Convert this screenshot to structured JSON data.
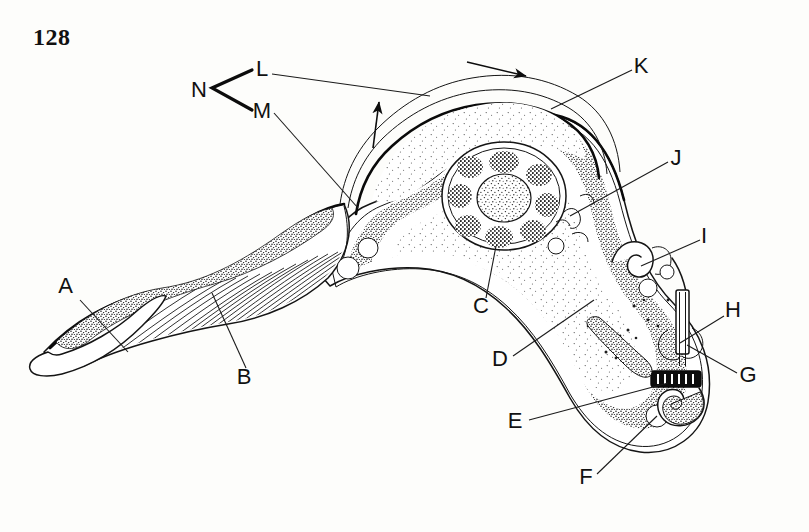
{
  "page": {
    "number": "128",
    "background_color": "#fdfdfb",
    "ink_color": "#141414"
  },
  "figure": {
    "style": "ink line drawing with stippling"
  },
  "labels": [
    {
      "id": "A",
      "text": "A",
      "x": 73,
      "y": 293,
      "anchor": "end",
      "leader": {
        "from": [
          80,
          300
        ],
        "to": [
          128,
          352
        ]
      }
    },
    {
      "id": "B",
      "text": "B",
      "x": 244,
      "y": 384,
      "anchor": "middle",
      "leader": {
        "from": [
          246,
          368
        ],
        "to": [
          212,
          293
        ]
      }
    },
    {
      "id": "C",
      "text": "C",
      "x": 481,
      "y": 313,
      "anchor": "middle",
      "leader": {
        "from": [
          486,
          298
        ],
        "to": [
          496,
          246
        ]
      }
    },
    {
      "id": "D",
      "text": "D",
      "x": 500,
      "y": 366,
      "anchor": "middle",
      "leader": {
        "from": [
          513,
          356
        ],
        "to": [
          594,
          300
        ]
      }
    },
    {
      "id": "E",
      "text": "E",
      "x": 515,
      "y": 428,
      "anchor": "middle",
      "leader": {
        "from": [
          529,
          420
        ],
        "to": [
          668,
          383
        ]
      }
    },
    {
      "id": "F",
      "text": "F",
      "x": 586,
      "y": 484,
      "anchor": "middle",
      "leader": {
        "from": [
          597,
          474
        ],
        "to": [
          657,
          416
        ]
      }
    },
    {
      "id": "G",
      "text": "G",
      "x": 748,
      "y": 382,
      "anchor": "middle",
      "leader": {
        "from": [
          737,
          373
        ],
        "to": [
          687,
          345
        ]
      }
    },
    {
      "id": "H",
      "text": "H",
      "x": 733,
      "y": 317,
      "anchor": "middle",
      "leader": {
        "from": [
          724,
          316
        ],
        "to": [
          680,
          343
        ]
      }
    },
    {
      "id": "I",
      "text": "I",
      "x": 704,
      "y": 243,
      "anchor": "middle",
      "leader": {
        "from": [
          700,
          240
        ],
        "to": [
          641,
          266
        ]
      }
    },
    {
      "id": "J",
      "text": "J",
      "x": 676,
      "y": 165,
      "anchor": "middle",
      "leader": {
        "from": [
          668,
          162
        ],
        "to": [
          570,
          216
        ]
      }
    },
    {
      "id": "K",
      "text": "K",
      "x": 641,
      "y": 73,
      "anchor": "middle",
      "leader": {
        "from": [
          632,
          70
        ],
        "to": [
          551,
          109
        ]
      }
    },
    {
      "id": "L",
      "text": "L",
      "x": 262,
      "y": 76,
      "anchor": "middle",
      "leader": {
        "from": [
          272,
          74
        ],
        "to": [
          430,
          96
        ]
      }
    },
    {
      "id": "M",
      "text": "M",
      "x": 262,
      "y": 116,
      "anchor": "middle",
      "leader": {
        "from": [
          274,
          113
        ],
        "to": [
          358,
          208
        ]
      }
    },
    {
      "id": "N",
      "text": "N",
      "x": 199,
      "y": 94,
      "anchor": "middle",
      "bracket": {
        "apex": [
          212,
          88
        ],
        "upper": [
          252,
          70
        ],
        "lower": [
          252,
          110
        ]
      }
    }
  ],
  "direction_arrows": [
    {
      "name": "membrane-flow-arrow-right",
      "from": [
        467,
        62
      ],
      "to": [
        528,
        76
      ]
    },
    {
      "name": "membrane-flow-arrow-up",
      "from": [
        373,
        148
      ],
      "to": [
        379,
        100
      ]
    }
  ],
  "structures": [
    {
      "name": "flagellum-free-end",
      "label_ref": "A"
    },
    {
      "name": "undulating-membrane",
      "label_ref": "B"
    },
    {
      "name": "nucleolus",
      "label_ref": "C"
    },
    {
      "name": "nucleus-chromatin",
      "label_ref": "D"
    },
    {
      "name": "posterior-cytoplasm",
      "label_ref": "E"
    },
    {
      "name": "vacuole",
      "label_ref": "F"
    },
    {
      "name": "kinetoplast",
      "label_ref": "G"
    },
    {
      "name": "basal-body",
      "label_ref": "H"
    },
    {
      "name": "flagellar-pocket",
      "label_ref": "I"
    },
    {
      "name": "golgi-region",
      "label_ref": "J"
    },
    {
      "name": "pellicle",
      "label_ref": "K"
    },
    {
      "name": "flagellum-attached",
      "label_ref": "L"
    },
    {
      "name": "membrane-fold",
      "label_ref": "M"
    },
    {
      "name": "bracket-group",
      "label_ref": "N"
    }
  ]
}
